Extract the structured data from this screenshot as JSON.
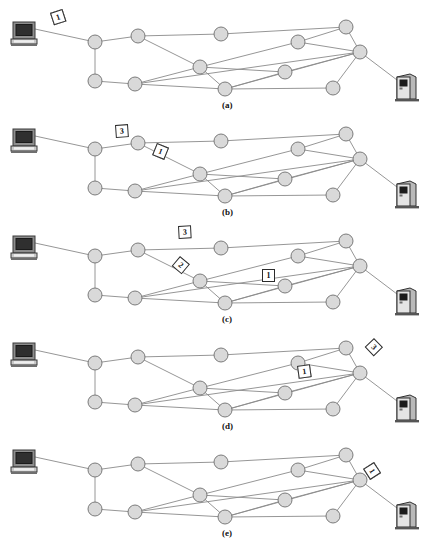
{
  "figure": {
    "kind": "packet-switching-network-sequence",
    "node_fill": "#d9d9d9",
    "node_stroke": "#6e6e6e",
    "edge_color": "#8a8a8a",
    "packet_border": "#2b2b2b",
    "packet_fill": "#ffffff"
  },
  "topology": {
    "nodes": [
      {
        "id": "n0",
        "x": 95,
        "y": 42
      },
      {
        "id": "n1",
        "x": 138,
        "y": 36
      },
      {
        "id": "n2",
        "x": 221,
        "y": 34
      },
      {
        "id": "n3",
        "x": 298,
        "y": 42
      },
      {
        "id": "n4",
        "x": 346,
        "y": 27
      },
      {
        "id": "n5",
        "x": 360,
        "y": 52
      },
      {
        "id": "n6",
        "x": 200,
        "y": 67
      },
      {
        "id": "n7",
        "x": 285,
        "y": 72
      },
      {
        "id": "n8",
        "x": 95,
        "y": 81
      },
      {
        "id": "n9",
        "x": 135,
        "y": 84
      },
      {
        "id": "n10",
        "x": 225,
        "y": 89
      },
      {
        "id": "n11",
        "x": 333,
        "y": 88
      }
    ],
    "edges": [
      [
        "n0",
        "n1"
      ],
      [
        "n0",
        "n8"
      ],
      [
        "n1",
        "n2"
      ],
      [
        "n1",
        "n6"
      ],
      [
        "n2",
        "n4"
      ],
      [
        "n3",
        "n4"
      ],
      [
        "n3",
        "n5"
      ],
      [
        "n3",
        "n6"
      ],
      [
        "n4",
        "n5"
      ],
      [
        "n5",
        "n7"
      ],
      [
        "n5",
        "n9"
      ],
      [
        "n5",
        "n10"
      ],
      [
        "n5",
        "n11"
      ],
      [
        "n6",
        "n7"
      ],
      [
        "n6",
        "n9"
      ],
      [
        "n6",
        "n10"
      ],
      [
        "n7",
        "n10"
      ],
      [
        "n8",
        "n9"
      ],
      [
        "n9",
        "n10"
      ],
      [
        "n10",
        "n11"
      ]
    ],
    "source_link": {
      "from": "computer",
      "to": "n0"
    },
    "dest_link": {
      "from": "n5",
      "to": "server"
    },
    "computer": {
      "x": 24,
      "y": 33
    },
    "server": {
      "x": 406,
      "y": 88
    }
  },
  "panels": [
    {
      "id": "a",
      "label": "(a)",
      "label_x": 222,
      "label_y": 100,
      "caption_note": "All three packets still queued at the source computer",
      "packets": [
        {
          "values": [
            "3",
            "2",
            "1"
          ],
          "x": 50,
          "y": 13,
          "rotate": -18
        }
      ]
    },
    {
      "id": "b",
      "label": "(b)",
      "label_x": 222,
      "label_y": 100,
      "caption_note": "Packet 3 at first router, packets 2 and 1 en route on the diagonal link",
      "packets": [
        {
          "values": [
            "3"
          ],
          "x": 115,
          "y": 18,
          "rotate": -4
        },
        {
          "values": [
            "2",
            "1"
          ],
          "x": 157,
          "y": 36,
          "rotate": 22
        }
      ]
    },
    {
      "id": "c",
      "label": "(c)",
      "label_x": 222,
      "label_y": 100,
      "caption_note": "Packets spread across three different links",
      "packets": [
        {
          "values": [
            "3"
          ],
          "x": 178,
          "y": 12,
          "rotate": -3
        },
        {
          "values": [
            "2"
          ],
          "x": 180,
          "y": 42,
          "rotate": 40
        },
        {
          "values": [
            "1"
          ],
          "x": 262,
          "y": 55,
          "rotate": 0
        }
      ]
    },
    {
      "id": "d",
      "label": "(d)",
      "label_x": 222,
      "label_y": 100,
      "caption_note": "Packets converging near the destination router",
      "packets": [
        {
          "values": [
            "3"
          ],
          "x": 374,
          "y": 17,
          "rotate": 46
        },
        {
          "values": [
            "2",
            "1"
          ],
          "x": 297,
          "y": 45,
          "rotate": -8
        }
      ]
    },
    {
      "id": "e",
      "label": "(e)",
      "label_x": 222,
      "label_y": 100,
      "caption_note": "All three packets delivered in order to the destination server",
      "packets": [
        {
          "values": [
            "3",
            "2",
            "1"
          ],
          "x": 374,
          "y": 34,
          "rotate": 57
        }
      ]
    }
  ]
}
